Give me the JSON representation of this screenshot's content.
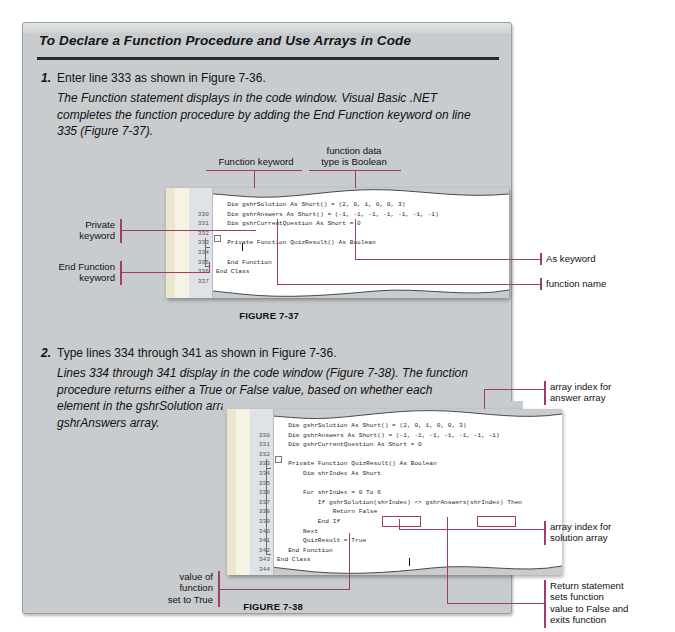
{
  "panel": {
    "title": "To Declare a Function Procedure and Use Arrays in Code"
  },
  "steps": [
    {
      "number": "1.",
      "head": "Enter line 333 as shown in Figure 7-36.",
      "body": "The Function statement displays in the code window. Visual Basic .NET completes the function procedure by adding the End Function keyword on line 335 (Figure 7-37)."
    },
    {
      "number": "2.",
      "head": "Type lines 334 through 341 as shown in Figure 7-36.",
      "body": "Lines 334 through 341 display in the code window (Figure 7-38). The function procedure returns either a True or False value, based on whether each element in the gshrSolution array matches the corres-ponding item in the gshrAnswers array."
    }
  ],
  "figure1": {
    "caption": "FIGURE 7-37",
    "line_numbers": [
      "",
      "330",
      "331",
      "332",
      "333",
      "334",
      "335",
      "336",
      "337"
    ],
    "code": [
      "   Dim gshrSolution As Short() = (2, 0, 1, 0, 0, 3)",
      "   Dim gshrAnswers As Short() = (-1, -1, -1, -1, -1, -1, -1)",
      "   Dim gshrCurrentQuestion As Short = 0",
      "",
      "   Private Function QuizResult() As Boolean",
      "",
      "   End Function",
      "End Class",
      ""
    ],
    "callouts": {
      "function_keyword": "Function keyword",
      "function_data_type": "function data\ntype is Boolean",
      "private_keyword": "Private\nkeyword",
      "end_function_keyword": "End Function\nkeyword",
      "as_keyword": "As keyword",
      "function_name": "function name"
    }
  },
  "figure2": {
    "caption": "FIGURE 7-38",
    "line_numbers": [
      "",
      "330",
      "331",
      "332",
      "333",
      "334",
      "335",
      "336",
      "337",
      "338",
      "339",
      "340",
      "341",
      "342",
      "343",
      "344"
    ],
    "code": [
      "   Dim gshrSolution As Short() = (2, 0, 1, 0, 0, 3)",
      "   Dim gshrAnswers As Short() = (-1, -1, -1, -1, -1, -1, -1)",
      "   Dim gshrCurrentQuestion As Short = 0",
      "",
      "   Private Function QuizResult() As Boolean",
      "       Dim shrIndex As Short",
      "",
      "       For shrIndex = 0 To 6",
      "           If gshrSolution(shrIndex) <> gshrAnswers(shrIndex) Then",
      "               Return False",
      "           End If",
      "       Next",
      "       QuizResult = True",
      "   End Function",
      "End Class",
      ""
    ],
    "callouts": {
      "answer_array_index": "array index for\nanswer array",
      "solution_array_index": "array index for\nsolution array",
      "value_of_function": "value of\nfunction\nset to True",
      "return_statement": "Return statement\nsets function\nvalue to False and\nexits function"
    }
  },
  "colors": {
    "panel_bg": "#c8ccce",
    "accent_pink": "#a23b6d",
    "code_bg": "#ffffff",
    "gutter_cream": "#ece6cf"
  }
}
